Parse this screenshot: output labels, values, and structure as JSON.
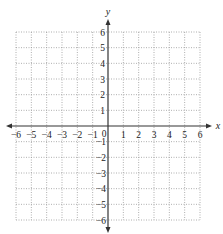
{
  "diagram": {
    "type": "coordinate-plane",
    "x_axis": {
      "label": "x",
      "min": -6,
      "max": 6,
      "ticks": [
        "-6",
        "-5",
        "-4",
        "-3",
        "-2",
        "-1",
        "0",
        "1",
        "2",
        "3",
        "4",
        "5",
        "6"
      ]
    },
    "y_axis": {
      "label": "y",
      "min": -6,
      "max": 6,
      "ticks_positive": [
        "1",
        "2",
        "3",
        "4",
        "5",
        "6"
      ],
      "ticks_negative": [
        "-1",
        "-2",
        "-3",
        "-4",
        "-5",
        "-6"
      ]
    },
    "grid": {
      "style": "dotted",
      "step": 1
    },
    "colors": {
      "axis": "#333333",
      "grid": "#9a9a9a",
      "text": "#222222"
    }
  },
  "labels": {
    "x": "x",
    "y": "y",
    "origin": "0",
    "xneg": [
      "−6",
      "−5",
      "−4",
      "−3",
      "−2",
      "−1"
    ],
    "xpos": [
      "1",
      "2",
      "3",
      "4",
      "5",
      "6"
    ],
    "ypos": [
      "1",
      "2",
      "3",
      "4",
      "5",
      "6"
    ],
    "yneg": [
      "−1",
      "−2",
      "−3",
      "−4",
      "−5",
      "−6"
    ]
  }
}
